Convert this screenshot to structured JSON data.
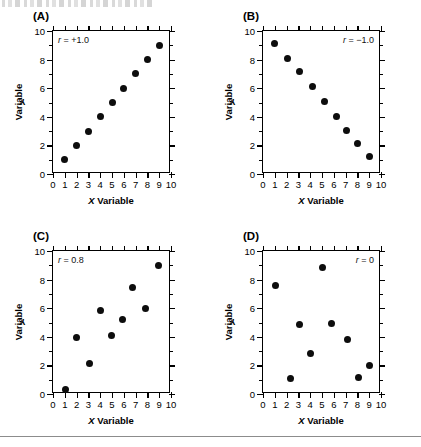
{
  "figure": {
    "top_artifact_present": true,
    "bottom_rule_present": true,
    "x_axis_title_prefix": "X",
    "x_axis_title_suffix": " Variable",
    "y_axis_title_prefix": "Y",
    "y_axis_title_suffix": " Variable",
    "dot_color": "#0d0d0d",
    "axis_color": "#000000"
  },
  "chart_data": [
    {
      "type": "scatter",
      "panel": "(A)",
      "title": "",
      "annotation": "r = +1.0",
      "annotation_position": "top-left",
      "correlation": 1.0,
      "xlabel": "X Variable",
      "ylabel": "Y Variable",
      "xlim": [
        0,
        10
      ],
      "ylim": [
        0,
        10
      ],
      "xticks": [
        0,
        1,
        2,
        3,
        4,
        5,
        6,
        7,
        8,
        9,
        10
      ],
      "yticks": [
        0,
        2,
        4,
        6,
        8,
        10
      ],
      "grid": false,
      "legend": "none",
      "x": [
        1,
        2,
        3,
        4,
        5,
        6,
        7,
        8,
        9
      ],
      "y": [
        1,
        2,
        3,
        4,
        5,
        6,
        7,
        8,
        9
      ]
    },
    {
      "type": "scatter",
      "panel": "(B)",
      "title": "",
      "annotation": "r = −1.0",
      "annotation_position": "top-right",
      "correlation": -1.0,
      "xlabel": "X Variable",
      "ylabel": "Y Variable",
      "xlim": [
        0,
        10
      ],
      "ylim": [
        0,
        10
      ],
      "xticks": [
        0,
        1,
        2,
        3,
        4,
        5,
        6,
        7,
        8,
        9,
        10
      ],
      "yticks": [
        0,
        2,
        4,
        6,
        8,
        10
      ],
      "grid": false,
      "legend": "none",
      "x": [
        1,
        2.1,
        3.1,
        4.2,
        5.2,
        6.2,
        7.1,
        8,
        9
      ],
      "y": [
        9.15,
        8.1,
        7.15,
        6.1,
        5.1,
        4,
        3.05,
        2.1,
        1.2
      ]
    },
    {
      "type": "scatter",
      "panel": "(C)",
      "title": "",
      "annotation": "r = 0.8",
      "annotation_position": "top-left",
      "correlation": 0.8,
      "xlabel": "X Variable",
      "ylabel": "Y Variable",
      "xlim": [
        0,
        10
      ],
      "ylim": [
        0,
        10
      ],
      "xticks": [
        0,
        1,
        2,
        3,
        4,
        5,
        6,
        7,
        8,
        9,
        10
      ],
      "yticks": [
        0,
        2,
        4,
        6,
        8,
        10
      ],
      "grid": false,
      "legend": "none",
      "x": [
        1.1,
        2,
        3.1,
        4,
        4.95,
        5.85,
        6.7,
        7.8,
        8.9
      ],
      "y": [
        0.3,
        3.95,
        2.15,
        5.85,
        4.1,
        5.2,
        7.45,
        5.95,
        9
      ]
    },
    {
      "type": "scatter",
      "panel": "(D)",
      "title": "",
      "annotation": "r = 0",
      "annotation_position": "top-right",
      "correlation": 0,
      "xlabel": "X Variable",
      "ylabel": "Y Variable",
      "xlim": [
        0,
        10
      ],
      "ylim": [
        0,
        10
      ],
      "xticks": [
        0,
        1,
        2,
        3,
        4,
        5,
        6,
        7,
        8,
        9,
        10
      ],
      "yticks": [
        0,
        2,
        4,
        6,
        8,
        10
      ],
      "grid": false,
      "legend": "none",
      "x": [
        1.1,
        2.3,
        3.1,
        4,
        5,
        5.8,
        7.2,
        8.1,
        9
      ],
      "y": [
        7.6,
        1.1,
        4.85,
        2.85,
        8.85,
        4.95,
        3.8,
        1.15,
        2
      ]
    }
  ]
}
